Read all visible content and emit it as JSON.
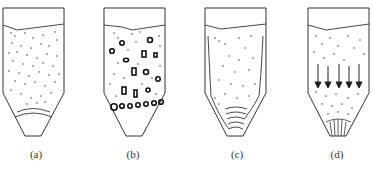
{
  "figure": {
    "panels": [
      {
        "id": "a",
        "label": "(a)",
        "description": "Silo filled with uniformly dispersed fine particles; curved arch lines near hopper outlet",
        "label_x": 36
      },
      {
        "id": "b",
        "label": "(b)",
        "description": "Silo with large agglomerates/lumps dispersed and accumulated forming a bridge above the hopper",
        "label_x": 133
      },
      {
        "id": "c",
        "label": "(c)",
        "description": "Silo with stagnant zones along walls and stacked arch layers at hopper outlet (funnel flow)",
        "label_x": 237
      },
      {
        "id": "d",
        "label": "(d)",
        "description": "Silo with uniform downward mass flow indicated by five vertical arrows; radial lines at outlet",
        "label_x": 337
      }
    ],
    "colors": {
      "line": "#333333",
      "particle": "#444444",
      "background": "#ffffff"
    }
  }
}
